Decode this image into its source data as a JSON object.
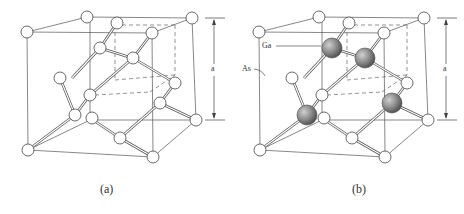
{
  "figure": {
    "panels": [
      {
        "id": "a",
        "caption": "(a)",
        "description": "Diamond lattice unit cell",
        "lattice_constant_label": "a",
        "atom_labels": []
      },
      {
        "id": "b",
        "caption": "(b)",
        "description": "Zinc blende lattice unit cell (GaAs)",
        "lattice_constant_label": "a",
        "atom_labels": [
          {
            "text": "Ga",
            "species": "gallium"
          },
          {
            "text": "As",
            "species": "arsenic"
          }
        ]
      }
    ],
    "colors": {
      "line": "#444444",
      "atom_fill": "#ffffff",
      "ga_fill": "#8a8a8a",
      "background": "#ffffff"
    }
  }
}
